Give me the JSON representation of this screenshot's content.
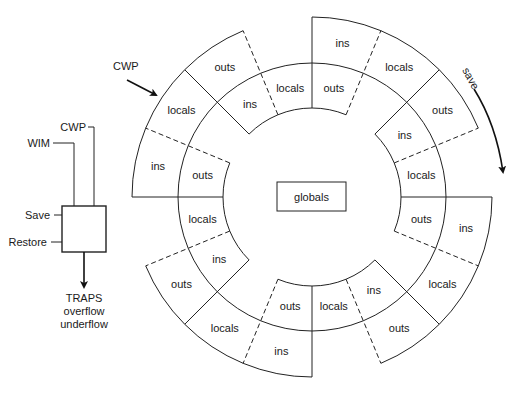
{
  "figure": {
    "type": "register-window-ring",
    "center_label": "globals",
    "ring": {
      "center": [
        312,
        197
      ],
      "radii": {
        "inner": 89,
        "mid": 134,
        "outer": 180
      },
      "sector_degrees": 22.5,
      "sectors": [
        {
          "from": 67.5,
          "to": 90,
          "outer": "ins",
          "inner": "outs"
        },
        {
          "from": 90,
          "to": 112.5,
          "outer": null,
          "inner": "locals"
        },
        {
          "from": 112.5,
          "to": 135,
          "outer": "outs",
          "inner": "ins"
        },
        {
          "from": 135,
          "to": 157.5,
          "outer": "locals",
          "inner": null
        },
        {
          "from": 157.5,
          "to": 180,
          "outer": "ins",
          "inner": "outs"
        },
        {
          "from": 180,
          "to": 202.5,
          "outer": null,
          "inner": "locals"
        },
        {
          "from": 202.5,
          "to": 225,
          "outer": "outs",
          "inner": "ins"
        },
        {
          "from": 225,
          "to": 247.5,
          "outer": "locals",
          "inner": null
        },
        {
          "from": 247.5,
          "to": 270,
          "outer": "ins",
          "inner": "outs"
        },
        {
          "from": 270,
          "to": 292.5,
          "outer": null,
          "inner": "locals"
        },
        {
          "from": 292.5,
          "to": 315,
          "outer": "outs",
          "inner": "ins"
        },
        {
          "from": 315,
          "to": 337.5,
          "outer": "locals",
          "inner": null
        },
        {
          "from": 337.5,
          "to": 360,
          "outer": "ins",
          "inner": "outs"
        },
        {
          "from": 0,
          "to": 22.5,
          "outer": null,
          "inner": "locals"
        },
        {
          "from": 22.5,
          "to": 45,
          "outer": "outs",
          "inner": "ins"
        },
        {
          "from": 45,
          "to": 67.5,
          "outer": "locals",
          "inner": null
        }
      ]
    },
    "annotations": {
      "cwp_pointer": "CWP",
      "save_direction": "save"
    },
    "control_block": {
      "inputs_top": [
        "CWP",
        "WIM"
      ],
      "inputs_left": [
        "Save",
        "Restore"
      ],
      "output_lines": [
        "TRAPS",
        "overflow",
        "underflow"
      ]
    }
  }
}
